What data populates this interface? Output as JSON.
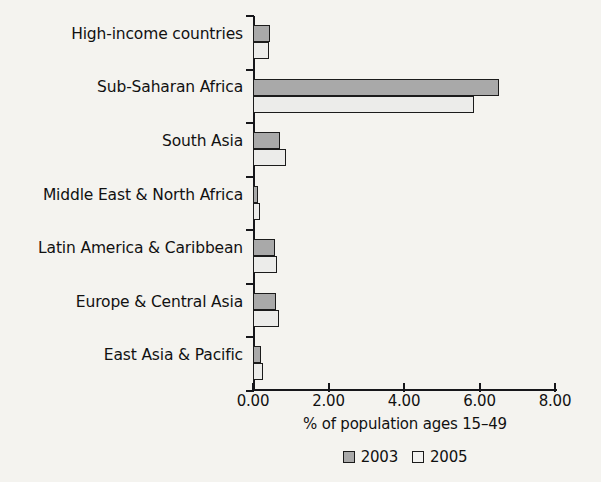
{
  "chart_data": {
    "type": "bar",
    "orientation": "horizontal",
    "title": "",
    "xlabel": "% of population ages 15–49",
    "ylabel": "",
    "xlim": [
      0,
      8
    ],
    "xticks": [
      "0.00",
      "2.00",
      "4.00",
      "6.00",
      "8.00"
    ],
    "xtick_values": [
      0,
      2,
      4,
      6,
      8
    ],
    "grid": false,
    "legend_position": "bottom-center",
    "categories": [
      "High-income countries",
      "Sub-Saharan Africa",
      "South Asia",
      "Middle East & North Africa",
      "Latin America & Caribbean",
      "Europe & Central Asia",
      "East Asia & Pacific"
    ],
    "series": [
      {
        "name": "2003",
        "color": "#a9a9a9",
        "values": [
          0.45,
          6.52,
          0.72,
          0.14,
          0.57,
          0.6,
          0.22
        ]
      },
      {
        "name": "2005",
        "color": "#ececea",
        "values": [
          0.42,
          5.85,
          0.88,
          0.19,
          0.64,
          0.68,
          0.26
        ]
      }
    ]
  },
  "legend": {
    "items": [
      {
        "label": "2003"
      },
      {
        "label": "2005"
      }
    ]
  },
  "colors": {
    "background": "#f4f3ef",
    "axis": "#16161a",
    "text": "#111111",
    "series_2003": "#a9a9a9",
    "series_2005": "#ececea",
    "bar_border": "#1b1b1b"
  }
}
